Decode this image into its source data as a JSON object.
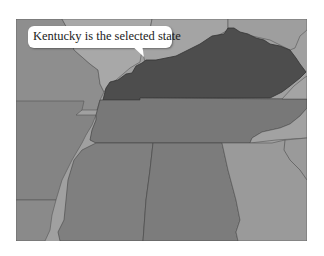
{
  "map": {
    "selected_state": "Kentucky",
    "callout_text": "Kentucky is the selected state",
    "colors": {
      "background": "#ffffff",
      "selected": "#4d4d4d",
      "tennessee": "#787878",
      "deep_south": "#7f7f7f",
      "west": "#8a8a8a",
      "north": "#a2a2a2",
      "east": "#9c9c9c",
      "border": "#4a4a4a"
    },
    "states": [
      {
        "name": "Kentucky",
        "selected": true
      },
      {
        "name": "Tennessee",
        "selected": false
      },
      {
        "name": "Mississippi",
        "selected": false
      },
      {
        "name": "Alabama",
        "selected": false
      },
      {
        "name": "Georgia",
        "selected": false
      },
      {
        "name": "Arkansas",
        "selected": false
      },
      {
        "name": "Missouri",
        "selected": false
      },
      {
        "name": "Illinois",
        "selected": false
      },
      {
        "name": "Indiana",
        "selected": false
      },
      {
        "name": "Ohio",
        "selected": false
      },
      {
        "name": "West Virginia",
        "selected": false
      },
      {
        "name": "Virginia",
        "selected": false
      },
      {
        "name": "North Carolina",
        "selected": false
      },
      {
        "name": "Louisiana",
        "selected": false
      }
    ]
  }
}
